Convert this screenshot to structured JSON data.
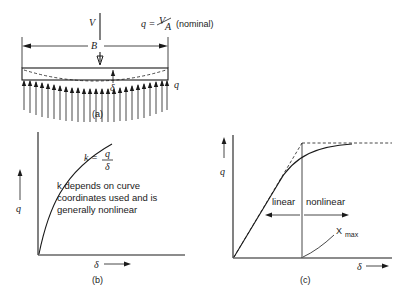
{
  "figure": {
    "title_caption_a": "(a)",
    "title_caption_b": "(b)",
    "title_caption_c": "(c)"
  },
  "panel_a": {
    "load_label": "V",
    "pressure_formula": "q = V/A  (nominal)",
    "q_numerator": "V",
    "q_denominator": "A",
    "q_prefix": "q =",
    "q_suffix": "(nominal)",
    "width_label": "B",
    "deflection_label": "δ",
    "reaction_label": "q",
    "caption": "(a)"
  },
  "panel_b": {
    "y_axis_label": "q",
    "x_axis_label": "δ",
    "k_prefix": "k =",
    "k_numerator": "q",
    "k_denominator": "δ",
    "note_line1": "k depends on curve",
    "note_line2": "coordinates used and is",
    "note_line3": "generally nonlinear",
    "caption": "(b)"
  },
  "panel_c": {
    "y_axis_label": "q",
    "x_axis_label": "δ",
    "linear_label": "linear",
    "nonlinear_label": "nonlinear",
    "xmax_label": "X",
    "xmax_sub": "max",
    "caption": "(c)"
  },
  "colors": {
    "ink": "#1a1a1a",
    "background": "#ffffff",
    "light_ink": "#555555"
  }
}
